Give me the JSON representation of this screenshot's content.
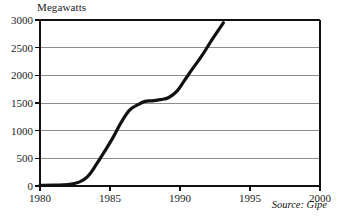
{
  "chart_data": {
    "type": "line",
    "title": "",
    "ylabel": "Megawatts",
    "xlabel": "",
    "xlim": [
      1980,
      2000
    ],
    "ylim": [
      0,
      3000
    ],
    "grid": true,
    "legend_position": "none",
    "annotations": [
      {
        "name": "source",
        "text": "Source: Gipe"
      }
    ],
    "yticks": [
      0,
      500,
      1000,
      1500,
      2000,
      2500,
      3000
    ],
    "ytick_labels": [
      "0",
      "500",
      "1000",
      "1500",
      "2000",
      "2500",
      "3000"
    ],
    "xticks": [
      1980,
      1985,
      1990,
      1995,
      2000
    ],
    "xtick_labels": [
      "1980",
      "1985",
      "1990",
      "1995",
      "2000"
    ],
    "series": [
      {
        "name": "Installed wind capacity",
        "color": "#111111",
        "x": [
          1980,
          1981,
          1982,
          1982.8,
          1983.4,
          1984,
          1984.6,
          1985.2,
          1985.8,
          1986.4,
          1987,
          1987.5,
          1988,
          1988.6,
          1989.2,
          1989.8,
          1990.3,
          1990.9,
          1991.6,
          1992.3,
          1993.1
        ],
        "values": [
          10,
          15,
          25,
          70,
          170,
          380,
          620,
          870,
          1150,
          1370,
          1470,
          1530,
          1540,
          1560,
          1600,
          1720,
          1900,
          2120,
          2370,
          2650,
          2950
        ]
      }
    ],
    "colors": {
      "line": "#111111",
      "grid": "#8d8d8d",
      "axis": "#111111",
      "text": "#1a1a1a",
      "background": "#ffffff"
    }
  },
  "figure": {
    "y_axis_title": "Megawatts",
    "source_text": "Source: Gipe"
  }
}
